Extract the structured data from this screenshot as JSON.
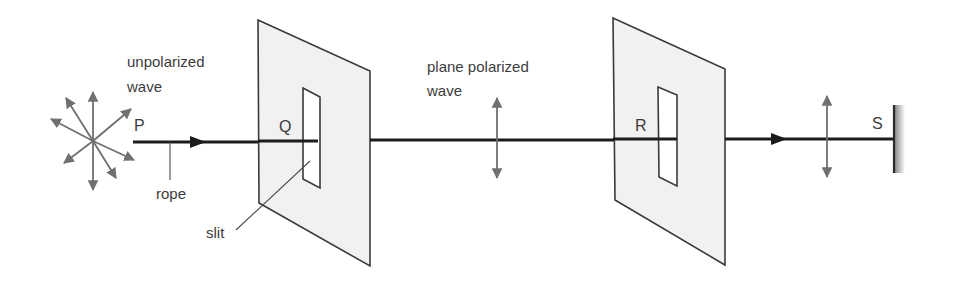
{
  "diagram": {
    "labels": {
      "unpolarized_line1": "unpolarized",
      "unpolarized_line2": "wave",
      "plane_line1": "plane polarized",
      "plane_line2": "wave",
      "rope": "rope",
      "slit": "slit"
    },
    "points": {
      "P": "P",
      "Q": "Q",
      "R": "R",
      "S": "S"
    },
    "elements": [
      {
        "name": "unpolarized-source",
        "description": "star of vibration directions (8 arrowheads)"
      },
      {
        "name": "rope",
        "description": "horizontal rope from P to fixed end S"
      },
      {
        "name": "polarizer-plate-1",
        "description": "plate with vertical slit at Q"
      },
      {
        "name": "polarizer-plate-2",
        "description": "plate with vertical slit at R"
      },
      {
        "name": "plane-polarized-arrow-1",
        "description": "vertical double arrow after first slit"
      },
      {
        "name": "plane-polarized-arrow-2",
        "description": "vertical double arrow after second slit"
      },
      {
        "name": "fixed-wall",
        "description": "hatched wall at S"
      }
    ],
    "colors": {
      "rope": "#1c1c1c",
      "vectors": "#707070",
      "plate_fill": "#f1f1f1",
      "outline": "#3a3a3a",
      "text": "#3c3c3c"
    }
  }
}
